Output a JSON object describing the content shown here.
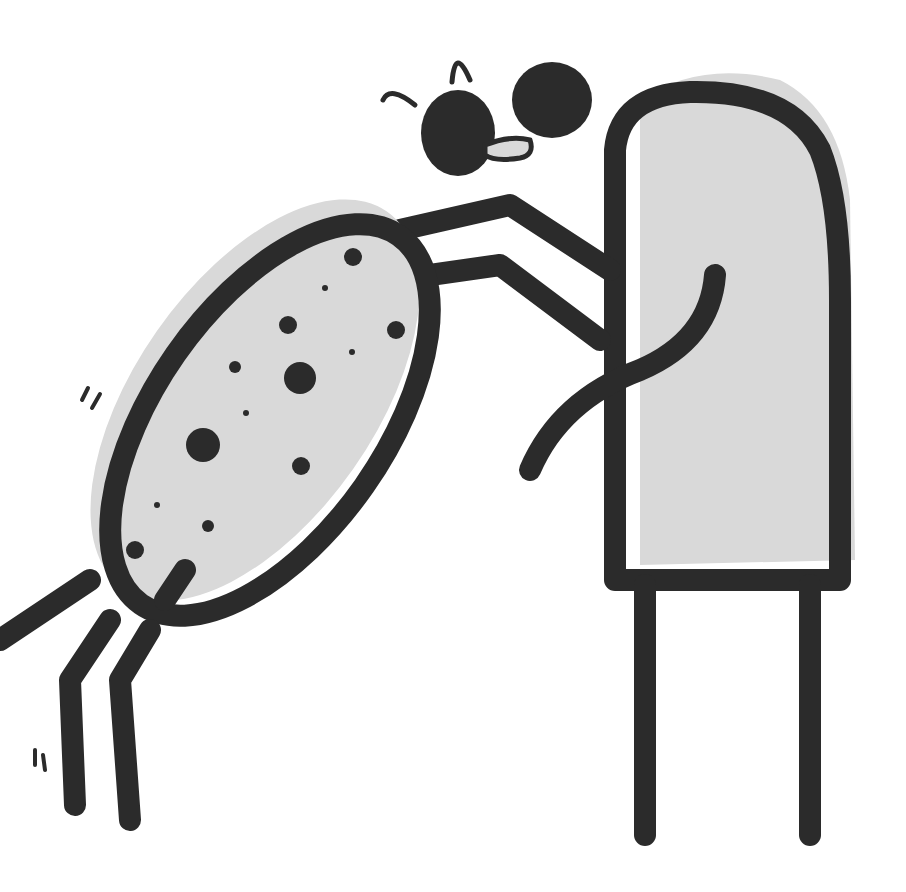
{
  "illustration": {
    "description": "Two cartoon figures: a spotted oval character leaning and hugging a tall rounded rectangle character, with a small heart-like pair of shapes above",
    "colors": {
      "ink": "#2b2b2b",
      "fill": "#d9d9d9",
      "background": "#ffffff"
    }
  }
}
